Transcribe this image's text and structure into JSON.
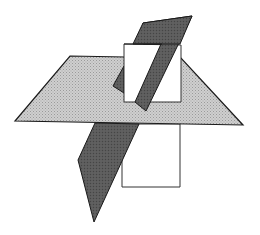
{
  "diagram": {
    "title": "",
    "planes": [
      {
        "name": "horizontal-plane",
        "fill": "#c4c4c4",
        "stroke": "#1a1a1a",
        "shading": "dotted-gray"
      },
      {
        "name": "vertical-plane",
        "fill": "#ffffff",
        "stroke": "#333333"
      },
      {
        "name": "oblique-plane",
        "fill": "#5e5e5e",
        "stroke": "#1a1a1a"
      }
    ],
    "colors": {
      "background": "#ffffff",
      "horizontal": "#c4c4c4",
      "vertical": "#ffffff",
      "oblique": "#5e5e5e",
      "edge": "#1a1a1a"
    }
  }
}
